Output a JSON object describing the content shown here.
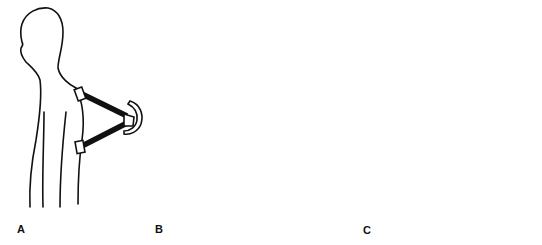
{
  "figure": {
    "panels": [
      {
        "id": "A",
        "label": "A",
        "posture": "upright standing, side view"
      },
      {
        "id": "B",
        "label": "B",
        "posture": "forward flexion, bent over"
      },
      {
        "id": "C",
        "label": "C",
        "posture": "backward extension, leaning back"
      }
    ],
    "colors": {
      "line": "#111111",
      "background": "#ffffff"
    }
  }
}
